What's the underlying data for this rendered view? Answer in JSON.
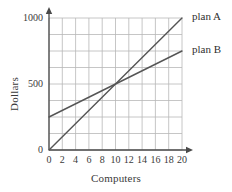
{
  "chart_data": {
    "type": "line",
    "title": "",
    "xlabel": "Computers",
    "ylabel": "Dollars",
    "xlim": [
      0,
      20
    ],
    "ylim": [
      0,
      1000
    ],
    "grid": true,
    "x_ticks": [
      "0",
      "2",
      "4",
      "6",
      "8",
      "10",
      "12",
      "14",
      "16",
      "18",
      "20"
    ],
    "x_tick_values": [
      0,
      2,
      4,
      6,
      8,
      10,
      12,
      14,
      16,
      18,
      20
    ],
    "y_ticks": [
      "0",
      "500",
      "1000"
    ],
    "y_tick_values": [
      0,
      500,
      1000
    ],
    "y_gridline_values": [
      0,
      125,
      250,
      375,
      500,
      625,
      750,
      875,
      1000
    ],
    "legend_position": "right-inline",
    "series": [
      {
        "name": "plan A",
        "x": [
          0,
          20
        ],
        "values": [
          0,
          1000
        ],
        "slope": 50,
        "intercept": 0,
        "color": "#555555"
      },
      {
        "name": "plan B",
        "x": [
          0,
          20
        ],
        "values": [
          250,
          750
        ],
        "slope": 25,
        "intercept": 250,
        "color": "#555555"
      }
    ],
    "annotations": [
      {
        "label": "intersection",
        "x": 10,
        "y": 500
      }
    ],
    "colors": {
      "grid": "#b8b8b8",
      "axis": "#4a4a4a",
      "line": "#555555",
      "text": "#3a3a3a",
      "background": "#ffffff"
    }
  }
}
